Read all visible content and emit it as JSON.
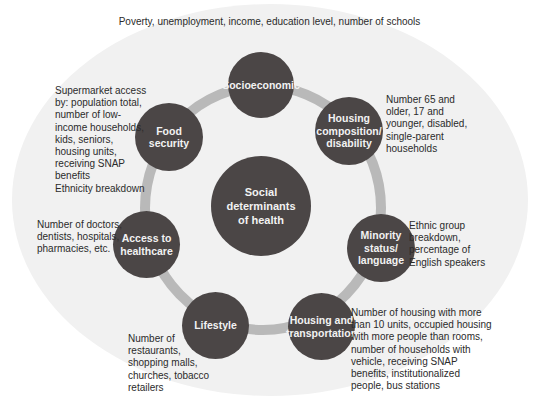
{
  "diagram": {
    "center": {
      "label": "Social\ndeterminants\nof health"
    },
    "nodes": [
      {
        "id": "socioeconomic",
        "label": "Socioeconomic",
        "description": "Poverty, unemployment, income, education level, number of schools"
      },
      {
        "id": "housing-composition",
        "label": "Housing\ncomposition/\ndisability",
        "description": "Number 65 and\nolder, 17 and\nyounger, disabled,\nsingle-parent\nhouseholds"
      },
      {
        "id": "minority-status",
        "label": "Minority\nstatus/\nlanguage",
        "description": "Ethnic group\nbreakdown,\npercentage of\nEnglish speakers"
      },
      {
        "id": "housing-transportation",
        "label": "Housing and\ntransportation",
        "description": "Number of housing with more\nthan 10 units, occupied housing\nwith more people than rooms,\nnumber of households with\nvehicle, receiving SNAP\nbenefits, institutionalized\npeople, bus stations"
      },
      {
        "id": "lifestyle",
        "label": "Lifestyle",
        "description": "Number of\nrestaurants,\nshopping malls,\nchurches, tobacco\nretailers"
      },
      {
        "id": "access-healthcare",
        "label": "Access to\nhealthcare",
        "description": "Number of doctors,\ndentists, hospitals,\npharmacies, etc."
      },
      {
        "id": "food-security",
        "label": "Food security",
        "description": "Supermarket access\nby: population total,\nnumber of low-\nincome households,\nkids, seniors,\nhousing units,\nreceiving SNAP\nbenefits\nEthnicity breakdown"
      }
    ],
    "colors": {
      "node_fill": "#4b4646",
      "node_text": "#f2f2f2",
      "ring": "#b9b9b9",
      "background_oval": "#f1f1f1"
    }
  }
}
